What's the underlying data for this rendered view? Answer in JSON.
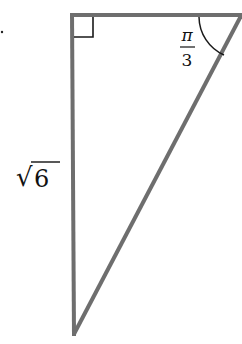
{
  "diagram": {
    "type": "right-triangle",
    "stroke_color": "#6e6e6e",
    "marker_color": "#1a1a1a",
    "vertices": {
      "right_angle": [
        72,
        15
      ],
      "top_right": [
        241,
        15
      ],
      "bottom": [
        74,
        334
      ]
    },
    "labels": {
      "angle_num": "π",
      "angle_den": "3",
      "side_radical": "√",
      "side_value": "6"
    }
  }
}
